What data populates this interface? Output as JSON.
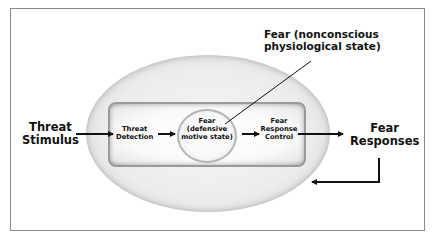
{
  "diagram": {
    "nodes": {
      "threat_stimulus": {
        "line1": "Threat",
        "line2": "Stimulus"
      },
      "threat_detection": {
        "line1": "Threat",
        "line2": "Detection"
      },
      "fear_defensive": {
        "line1": "Fear",
        "line2": "(defensive",
        "line3": "motive state)"
      },
      "fear_response_control": {
        "line1": "Fear",
        "line2": "Response",
        "line3": "Control"
      },
      "fear_responses": {
        "line1": "Fear",
        "line2": "Responses"
      },
      "fear_nonconscious": {
        "line1": "Fear (nonconscious",
        "line2": "physiological state)"
      }
    },
    "edges": [
      {
        "from": "Threat Stimulus",
        "to": "Threat Detection"
      },
      {
        "from": "Threat Detection",
        "to": "Fear (defensive motive state)"
      },
      {
        "from": "Fear (defensive motive state)",
        "to": "Fear Response Control"
      },
      {
        "from": "Fear Response Control",
        "to": "Fear Responses"
      },
      {
        "from": "Fear Responses",
        "to": "Fear (nonconscious physiological state)",
        "type": "feedback"
      }
    ],
    "callout": {
      "label": "Fear (nonconscious physiological state)",
      "points_to": "Fear (defensive motive state)"
    },
    "colors": {
      "ellipse_edge": "#8f8f8f",
      "ellipse_fill": "#ececec",
      "text": "#111111",
      "frame": "#8a8a8a"
    }
  }
}
